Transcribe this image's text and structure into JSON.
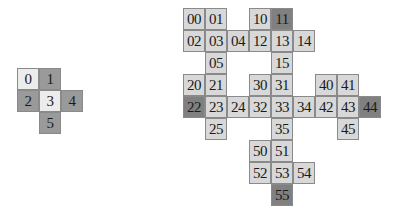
{
  "colors": {
    "light": "#d8d8d8",
    "mid": "#9a9a9a",
    "dark": "#808080",
    "pale": "#ececec"
  },
  "left_grid": {
    "cells": [
      {
        "label": "0",
        "x": 17,
        "y": 68,
        "shade": "white"
      },
      {
        "label": "1",
        "x": 39,
        "y": 68,
        "shade": "mid"
      },
      {
        "label": "2",
        "x": 17,
        "y": 90,
        "shade": "mid"
      },
      {
        "label": "3",
        "x": 39,
        "y": 90,
        "shade": "white"
      },
      {
        "label": "4",
        "x": 61,
        "y": 90,
        "shade": "mid"
      },
      {
        "label": "5",
        "x": 39,
        "y": 112,
        "shade": "mid"
      }
    ]
  },
  "right_grid": {
    "cells": [
      {
        "label": "00",
        "x": 183,
        "y": 8,
        "shade": "light"
      },
      {
        "label": "01",
        "x": 205,
        "y": 8,
        "shade": "light"
      },
      {
        "label": "10",
        "x": 249,
        "y": 8,
        "shade": "light"
      },
      {
        "label": "11",
        "x": 271,
        "y": 8,
        "shade": "dark"
      },
      {
        "label": "02",
        "x": 183,
        "y": 30,
        "shade": "light"
      },
      {
        "label": "03",
        "x": 205,
        "y": 30,
        "shade": "light"
      },
      {
        "label": "04",
        "x": 227,
        "y": 30,
        "shade": "light"
      },
      {
        "label": "12",
        "x": 249,
        "y": 30,
        "shade": "light"
      },
      {
        "label": "13",
        "x": 271,
        "y": 30,
        "shade": "light"
      },
      {
        "label": "14",
        "x": 293,
        "y": 30,
        "shade": "light"
      },
      {
        "label": "05",
        "x": 205,
        "y": 52,
        "shade": "light"
      },
      {
        "label": "15",
        "x": 271,
        "y": 52,
        "shade": "light"
      },
      {
        "label": "20",
        "x": 183,
        "y": 74,
        "shade": "light"
      },
      {
        "label": "21",
        "x": 205,
        "y": 74,
        "shade": "light"
      },
      {
        "label": "30",
        "x": 249,
        "y": 74,
        "shade": "light"
      },
      {
        "label": "31",
        "x": 271,
        "y": 74,
        "shade": "light"
      },
      {
        "label": "40",
        "x": 315,
        "y": 74,
        "shade": "light"
      },
      {
        "label": "41",
        "x": 337,
        "y": 74,
        "shade": "light"
      },
      {
        "label": "22",
        "x": 183,
        "y": 96,
        "shade": "dark"
      },
      {
        "label": "23",
        "x": 205,
        "y": 96,
        "shade": "light"
      },
      {
        "label": "24",
        "x": 227,
        "y": 96,
        "shade": "light"
      },
      {
        "label": "32",
        "x": 249,
        "y": 96,
        "shade": "light"
      },
      {
        "label": "33",
        "x": 271,
        "y": 96,
        "shade": "light"
      },
      {
        "label": "34",
        "x": 293,
        "y": 96,
        "shade": "light"
      },
      {
        "label": "42",
        "x": 315,
        "y": 96,
        "shade": "light"
      },
      {
        "label": "43",
        "x": 337,
        "y": 96,
        "shade": "light"
      },
      {
        "label": "44",
        "x": 359,
        "y": 96,
        "shade": "dark"
      },
      {
        "label": "25",
        "x": 205,
        "y": 118,
        "shade": "light"
      },
      {
        "label": "35",
        "x": 271,
        "y": 118,
        "shade": "light"
      },
      {
        "label": "45",
        "x": 337,
        "y": 118,
        "shade": "light"
      },
      {
        "label": "50",
        "x": 249,
        "y": 140,
        "shade": "light"
      },
      {
        "label": "51",
        "x": 271,
        "y": 140,
        "shade": "light"
      },
      {
        "label": "52",
        "x": 249,
        "y": 162,
        "shade": "light"
      },
      {
        "label": "53",
        "x": 271,
        "y": 162,
        "shade": "light"
      },
      {
        "label": "54",
        "x": 293,
        "y": 162,
        "shade": "light"
      },
      {
        "label": "55",
        "x": 271,
        "y": 184,
        "shade": "dark"
      }
    ]
  }
}
